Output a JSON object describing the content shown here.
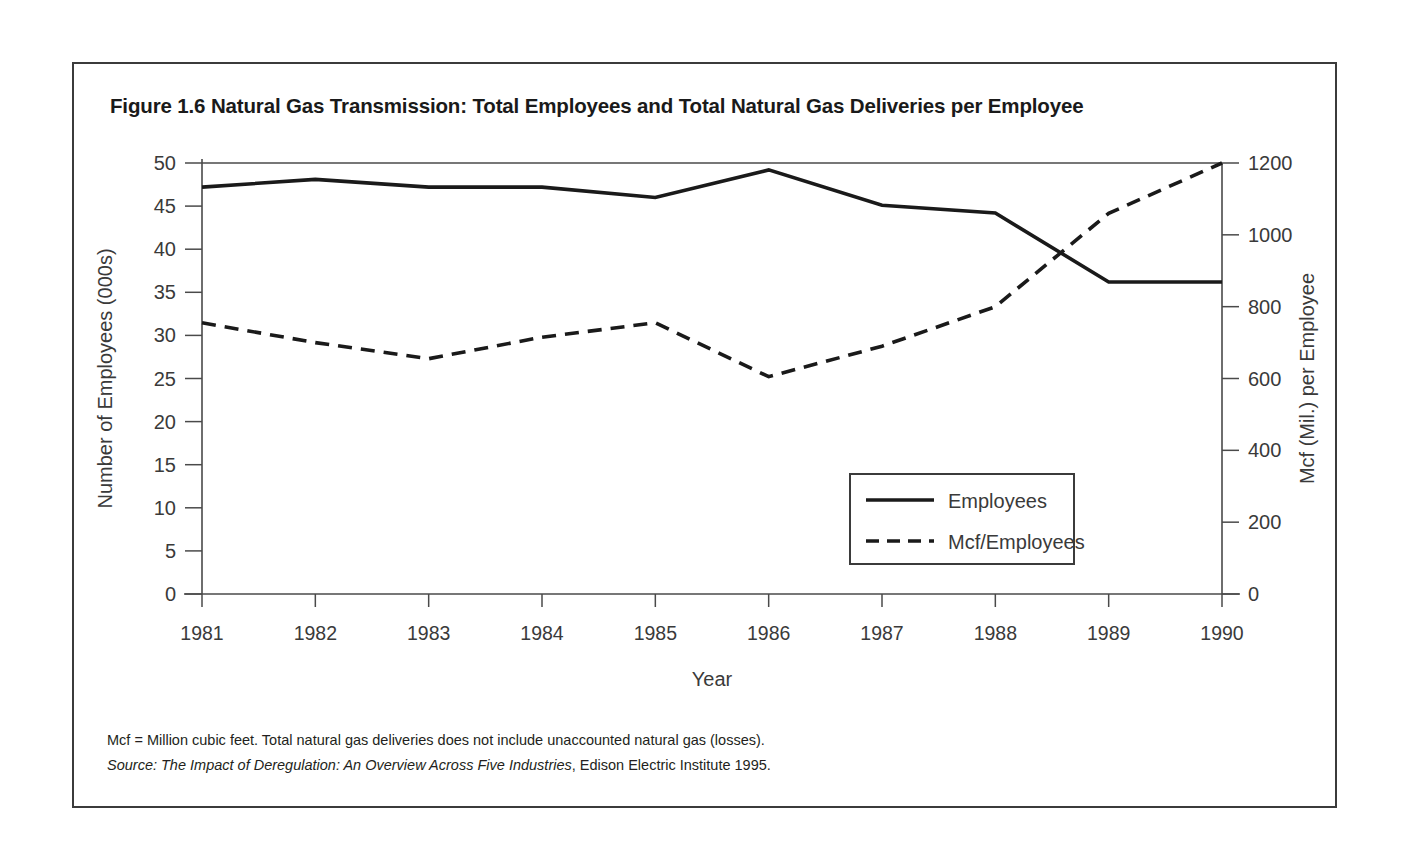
{
  "figure": {
    "title": "Figure 1.6 Natural Gas Transmission: Total Employees and Total Natural Gas Deliveries per Employee",
    "note": "Mcf = Million cubic feet. Total natural gas deliveries does not include unaccounted natural gas (losses).",
    "source_prefix": "Source:",
    "source_title": "The Impact of Deregulation: An Overview Across Five Industries",
    "source_rest": ", Edison Electric Institute 1995.",
    "border_color": "#3b3b3b"
  },
  "chart_data": {
    "type": "line",
    "title": "Figure 1.6 Natural Gas Transmission: Total Employees and Total Natural Gas Deliveries per Employee",
    "xlabel": "Year",
    "ylabel": "Number of Employees (000s)",
    "y2label": "Mcf (Mil.) per Employee",
    "categories": [
      "1981",
      "1982",
      "1983",
      "1984",
      "1985",
      "1986",
      "1987",
      "1988",
      "1989",
      "1990"
    ],
    "x": [
      1981,
      1982,
      1983,
      1984,
      1985,
      1986,
      1987,
      1988,
      1989,
      1990
    ],
    "xlim": [
      1981,
      1990
    ],
    "ylim": [
      0,
      50
    ],
    "y2lim": [
      0,
      1200
    ],
    "yticks": [
      0,
      5,
      10,
      15,
      20,
      25,
      30,
      35,
      40,
      45,
      50
    ],
    "y2ticks": [
      0,
      200,
      400,
      600,
      800,
      1000,
      1200
    ],
    "grid": false,
    "legend_position": "inside-lower-right",
    "series": [
      {
        "name": "Employees",
        "axis": "left",
        "style": "solid",
        "color": "#1a1a1a",
        "values": [
          47.2,
          48.1,
          47.2,
          47.2,
          46.0,
          49.2,
          45.1,
          44.2,
          36.2,
          36.2
        ]
      },
      {
        "name": "Mcf/Employees",
        "axis": "right",
        "style": "dashed",
        "color": "#1a1a1a",
        "values": [
          755,
          700,
          655,
          715,
          755,
          605,
          690,
          800,
          1060,
          1200
        ]
      }
    ]
  },
  "legend": {
    "items": [
      {
        "label": "Employees",
        "style": "solid"
      },
      {
        "label": "Mcf/Employees",
        "style": "dashed"
      }
    ]
  }
}
